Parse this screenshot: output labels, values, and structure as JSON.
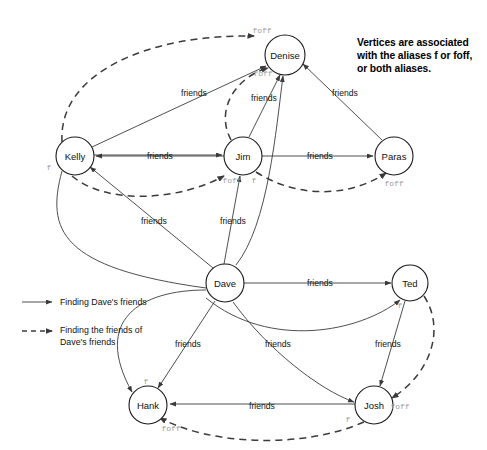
{
  "diagram": {
    "title_note": {
      "line1": "Vertices are associated",
      "line2": "with the aliases f or foff,",
      "line3": "or both aliases."
    },
    "nodes": [
      {
        "id": "denise",
        "label": "Denise",
        "cx": 285,
        "cy": 55,
        "r": 20
      },
      {
        "id": "kelly",
        "label": "Kelly",
        "cx": 75,
        "cy": 156,
        "r": 19
      },
      {
        "id": "jim",
        "label": "Jim",
        "cx": 243,
        "cy": 156,
        "r": 19
      },
      {
        "id": "paras",
        "label": "Paras",
        "cx": 394,
        "cy": 156,
        "r": 19
      },
      {
        "id": "dave",
        "label": "Dave",
        "cx": 225,
        "cy": 283,
        "r": 19
      },
      {
        "id": "ted",
        "label": "Ted",
        "cx": 410,
        "cy": 283,
        "r": 18
      },
      {
        "id": "hank",
        "label": "Hank",
        "cx": 148,
        "cy": 405,
        "r": 19
      },
      {
        "id": "josh",
        "label": "Josh",
        "cx": 374,
        "cy": 405,
        "r": 19
      }
    ],
    "edge_label_text": "friends",
    "edge_labels": [
      {
        "id": "kelly-jim",
        "text": "friends",
        "x": 160,
        "y": 156
      },
      {
        "id": "jim-paras",
        "text": "friends",
        "x": 320,
        "y": 156
      },
      {
        "id": "kelly-denise",
        "text": "friends",
        "x": 194,
        "y": 93
      },
      {
        "id": "jim-denise",
        "text": "friends",
        "x": 264,
        "y": 98
      },
      {
        "id": "paras-denise",
        "text": "friends",
        "x": 345,
        "y": 93
      },
      {
        "id": "dave-kelly",
        "text": "friends",
        "x": 154,
        "y": 221
      },
      {
        "id": "dave-jim",
        "text": "friends",
        "x": 233,
        "y": 221
      },
      {
        "id": "dave-ted",
        "text": "friends",
        "x": 320,
        "y": 283
      },
      {
        "id": "dave-hank",
        "text": "friends",
        "x": 188,
        "y": 344
      },
      {
        "id": "dave-josh",
        "text": "friends",
        "x": 278,
        "y": 344
      },
      {
        "id": "ted-josh",
        "text": "friends",
        "x": 388,
        "y": 344
      },
      {
        "id": "josh-hank",
        "text": "friends",
        "x": 262,
        "y": 406
      }
    ],
    "alias_labels": [
      {
        "id": "denise-top-foff",
        "text": "foff",
        "x": 262,
        "y": 30
      },
      {
        "id": "denise-lower-foff",
        "text": "foff",
        "x": 263,
        "y": 73
      },
      {
        "id": "kelly-f",
        "text": "f",
        "x": 49,
        "y": 167
      },
      {
        "id": "jim-foff",
        "text": "foff",
        "x": 232,
        "y": 180
      },
      {
        "id": "jim-f",
        "text": "f",
        "x": 254,
        "y": 180
      },
      {
        "id": "paras-foff",
        "text": "foff",
        "x": 394,
        "y": 183
      },
      {
        "id": "ted-f",
        "text": "f",
        "x": 400,
        "y": 305
      },
      {
        "id": "josh-foff",
        "text": "foff",
        "x": 400,
        "y": 406
      },
      {
        "id": "josh-f",
        "text": "f",
        "x": 348,
        "y": 419
      },
      {
        "id": "hank-f",
        "text": "f",
        "x": 146,
        "y": 381
      },
      {
        "id": "hank-foff",
        "text": "foff",
        "x": 171,
        "y": 428
      }
    ],
    "legend": {
      "items": [
        {
          "id": "solid",
          "style": "solid",
          "label": "Finding Dave's friends"
        },
        {
          "id": "dashed",
          "style": "dashed",
          "label_line1": "Finding the friends of",
          "label_line2": "Dave's friends"
        }
      ]
    },
    "colors": {
      "ink": "#1a1a1a",
      "edge": "#3b3b3b",
      "alias": "#9a9a9a",
      "background": "#ffffff"
    }
  }
}
